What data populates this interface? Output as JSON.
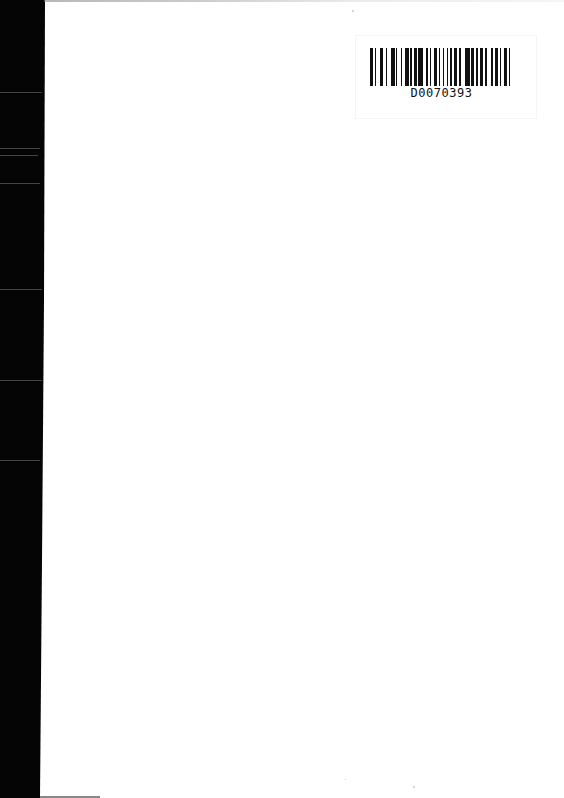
{
  "document": {
    "type": "scanned-page",
    "background_color": "#ffffff",
    "scan_edge_color": "#050505"
  },
  "barcode": {
    "id_text": "D0070393",
    "bar_color": "#111111"
  }
}
